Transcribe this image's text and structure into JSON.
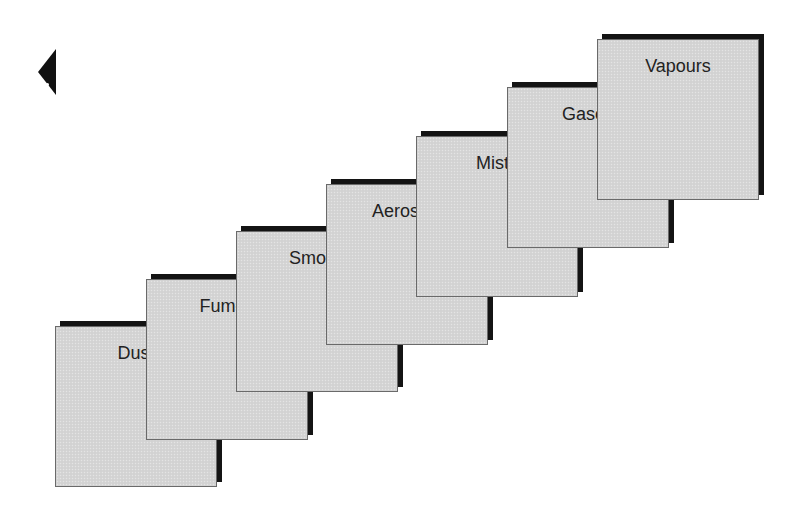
{
  "navigation": {
    "back_icon": "triangle-left-icon"
  },
  "diagram": {
    "type": "staircase-cards",
    "colors": {
      "card_fill": "#d5d5d5",
      "card_shadow": "#141414",
      "card_border": "#6a6a6a",
      "label_text": "#222222",
      "background": "#ffffff"
    },
    "cards": [
      {
        "label": "Dust",
        "x": 55,
        "y": 326
      },
      {
        "label": "Fumes",
        "x": 146,
        "y": 279
      },
      {
        "label": "Smoke",
        "x": 236,
        "y": 231
      },
      {
        "label": "Aerosols",
        "x": 326,
        "y": 184
      },
      {
        "label": "Mists",
        "x": 416,
        "y": 136
      },
      {
        "label": "Gases",
        "x": 507,
        "y": 87
      },
      {
        "label": "Vapours",
        "x": 597,
        "y": 39
      }
    ]
  }
}
